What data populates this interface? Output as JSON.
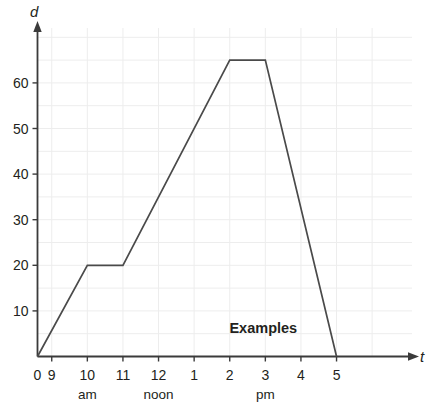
{
  "chart_data": {
    "type": "line",
    "title": "",
    "xlabel": "t",
    "ylabel": "d",
    "xlim": [
      0,
      5.6
    ],
    "ylim": [
      0,
      72
    ],
    "grid": true,
    "legend": null,
    "x_axis_label": "t",
    "y_axis_label": "d",
    "x_tick_labels": [
      "0",
      "9",
      "10",
      "11",
      "12",
      "1",
      "2",
      "3",
      "4",
      "5"
    ],
    "x_tick_values": [
      0,
      0.4,
      1.4,
      2.4,
      3.4,
      4.4,
      5.4,
      6.4,
      7.4,
      8.4
    ],
    "x_period_labels": [
      {
        "text": "am",
        "position": 1.4
      },
      {
        "text": "noon",
        "position": 3.4
      },
      {
        "text": "pm",
        "position": 6.4
      }
    ],
    "y_tick_labels": [
      "10",
      "20",
      "30",
      "40",
      "50",
      "60"
    ],
    "y_tick_values": [
      10,
      20,
      30,
      40,
      50,
      60
    ],
    "series": [
      {
        "name": "distance",
        "points": [
          {
            "t": 0.0,
            "d": 0
          },
          {
            "t": 1.4,
            "d": 20
          },
          {
            "t": 2.4,
            "d": 20
          },
          {
            "t": 5.4,
            "d": 65
          },
          {
            "t": 6.4,
            "d": 65
          },
          {
            "t": 8.4,
            "d": 0
          }
        ]
      }
    ],
    "annotations": [
      {
        "text": "Examples",
        "t": 6.6,
        "d": 5
      }
    ]
  },
  "colors": {
    "background": "#ffffff",
    "grid": "#ededed",
    "axis": "#3b3b3b",
    "data_line": "#4a4a4a",
    "text": "#231f20"
  }
}
